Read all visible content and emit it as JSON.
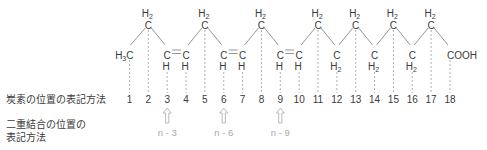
{
  "labels": {
    "carbon_position_notation": "炭素の位置の表記方法",
    "double_bond_notation_line1": "二重結合の位置の",
    "double_bond_notation_line2": "表記方法"
  },
  "molecule": {
    "atoms": [
      {
        "n": 1,
        "pos": "low",
        "top": "",
        "main": "H3C",
        "bottom": ""
      },
      {
        "n": 2,
        "pos": "high",
        "top": "H2",
        "main": "C",
        "bottom": ""
      },
      {
        "n": 3,
        "pos": "low",
        "top": "",
        "main": "C",
        "bottom": "H"
      },
      {
        "n": 4,
        "pos": "low",
        "top": "",
        "main": "C",
        "bottom": "H"
      },
      {
        "n": 5,
        "pos": "high",
        "top": "H2",
        "main": "C",
        "bottom": ""
      },
      {
        "n": 6,
        "pos": "low",
        "top": "",
        "main": "C",
        "bottom": "H"
      },
      {
        "n": 7,
        "pos": "low",
        "top": "",
        "main": "C",
        "bottom": "H"
      },
      {
        "n": 8,
        "pos": "high",
        "top": "H2",
        "main": "C",
        "bottom": ""
      },
      {
        "n": 9,
        "pos": "low",
        "top": "",
        "main": "C",
        "bottom": "H"
      },
      {
        "n": 10,
        "pos": "low",
        "top": "",
        "main": "C",
        "bottom": "H"
      },
      {
        "n": 11,
        "pos": "high",
        "top": "H2",
        "main": "C",
        "bottom": ""
      },
      {
        "n": 12,
        "pos": "low",
        "top": "",
        "main": "C",
        "bottom": "H2"
      },
      {
        "n": 13,
        "pos": "high",
        "top": "H2",
        "main": "C",
        "bottom": ""
      },
      {
        "n": 14,
        "pos": "low",
        "top": "",
        "main": "C",
        "bottom": "H2"
      },
      {
        "n": 15,
        "pos": "high",
        "top": "H2",
        "main": "C",
        "bottom": ""
      },
      {
        "n": 16,
        "pos": "low",
        "top": "",
        "main": "C",
        "bottom": "H2"
      },
      {
        "n": 17,
        "pos": "high",
        "top": "H2",
        "main": "C",
        "bottom": ""
      },
      {
        "n": 18,
        "pos": "low",
        "top": "",
        "main": "COOH",
        "bottom": ""
      }
    ],
    "double_bonds": [
      [
        3,
        4
      ],
      [
        6,
        7
      ],
      [
        9,
        10
      ]
    ]
  },
  "position_numbers": [
    "1",
    "2",
    "3",
    "4",
    "5",
    "6",
    "7",
    "8",
    "9",
    "10",
    "11",
    "12",
    "13",
    "14",
    "15",
    "16",
    "17",
    "18"
  ],
  "omega_markers": [
    {
      "at": 3,
      "label": "n - 3"
    },
    {
      "at": 6,
      "label": "n - 6"
    },
    {
      "at": 9,
      "label": "n - 9"
    }
  ],
  "colors": {
    "text": "#3a3a3a",
    "bond": "#8a8a8a",
    "guide": "#b0b0b0",
    "marker": "#a8a8a8"
  }
}
